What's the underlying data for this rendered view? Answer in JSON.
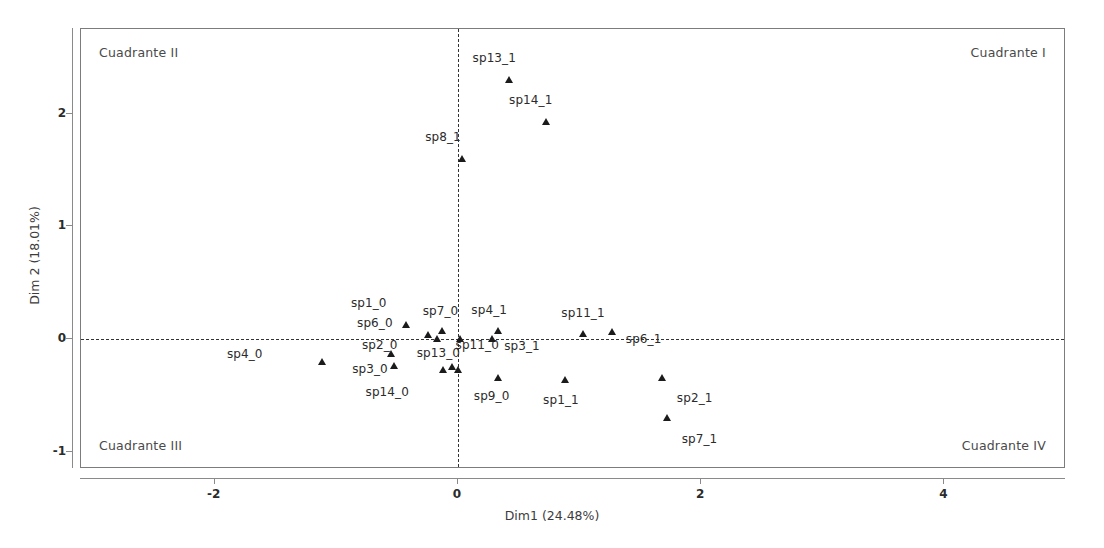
{
  "chart_data": {
    "type": "scatter",
    "title": "",
    "xlabel": "Dim1 (24.48%)",
    "ylabel": "Dim 2 (18.01%)",
    "xlim": [
      -3.1,
      5.0
    ],
    "ylim": [
      -1.15,
      2.75
    ],
    "xticks": [
      -2,
      0,
      2,
      4
    ],
    "xticklabels": [
      "-2",
      "0",
      "2",
      "4"
    ],
    "yticks": [
      -1,
      0,
      1,
      2
    ],
    "yticklabels": [
      "-1",
      "0",
      "1",
      "2"
    ],
    "grid": false,
    "legend": null,
    "reference_lines": {
      "vertical_x": 0,
      "horizontal_y": 0,
      "style": "dashed"
    },
    "annotations": [
      {
        "name": "quadrant-top-left",
        "text": "Cuadrante II"
      },
      {
        "name": "quadrant-top-right",
        "text": "Cuadrante I"
      },
      {
        "name": "quadrant-bottom-left",
        "text": "Cuadrante III"
      },
      {
        "name": "quadrant-bottom-right",
        "text": "Cuadrante IV"
      }
    ],
    "marker": {
      "shape": "triangle",
      "color": "#1b1b1b",
      "size": 7
    },
    "points": [
      {
        "label": "sp13_1",
        "x": 0.42,
        "y": 2.3,
        "lx": -0.3,
        "ly": 0.19
      },
      {
        "label": "sp14_1",
        "x": 0.72,
        "y": 1.93,
        "lx": -0.3,
        "ly": 0.19
      },
      {
        "label": "sp8_1",
        "x": 0.03,
        "y": 1.6,
        "lx": -0.3,
        "ly": 0.19
      },
      {
        "label": "sp1_0",
        "x": -0.43,
        "y": 0.13,
        "lx": -0.45,
        "ly": 0.19
      },
      {
        "label": "sp7_0",
        "x": -0.13,
        "y": 0.07,
        "lx": -0.16,
        "ly": 0.18
      },
      {
        "label": "sp6_0",
        "x": -0.25,
        "y": 0.04,
        "lx": -0.58,
        "ly": 0.1
      },
      {
        "label": "sp2_0",
        "x": -0.17,
        "y": 0.0,
        "lx": -0.62,
        "ly": -0.05
      },
      {
        "label": "sp11_0",
        "x": 0.02,
        "y": 0.0,
        "lx": -0.04,
        "ly": -0.05
      },
      {
        "label": "sp4_1",
        "x": 0.33,
        "y": 0.07,
        "lx": -0.22,
        "ly": 0.19
      },
      {
        "label": "sp3_1",
        "x": 0.28,
        "y": 0.0,
        "lx": 0.1,
        "ly": -0.06
      },
      {
        "label": "sp11_1",
        "x": 1.03,
        "y": 0.05,
        "lx": -0.18,
        "ly": 0.18
      },
      {
        "label": "sp6_1",
        "x": 1.27,
        "y": 0.06,
        "lx": 0.11,
        "ly": -0.06
      },
      {
        "label": "sp4_0",
        "x": -1.12,
        "y": -0.2,
        "lx": -0.78,
        "ly": 0.07
      },
      {
        "label": "sp3_0",
        "x": -0.55,
        "y": -0.13,
        "lx": -0.32,
        "ly": -0.13
      },
      {
        "label": "sp14_0",
        "x": -0.53,
        "y": -0.24,
        "lx": -0.23,
        "ly": -0.23
      },
      {
        "label": "sp13_0",
        "x": -0.12,
        "y": -0.27,
        "lx": -0.22,
        "ly": 0.15
      },
      {
        "label": "sp13_0b",
        "x": 0.0,
        "y": -0.27,
        "lx": null,
        "ly": null
      },
      {
        "label": "sp13_0c",
        "x": -0.05,
        "y": -0.25,
        "lx": null,
        "ly": null
      },
      {
        "label": "sp9_0",
        "x": 0.33,
        "y": -0.34,
        "lx": -0.2,
        "ly": -0.16
      },
      {
        "label": "sp1_1",
        "x": 0.88,
        "y": -0.36,
        "lx": -0.18,
        "ly": -0.18
      },
      {
        "label": "sp2_1",
        "x": 1.68,
        "y": -0.34,
        "lx": 0.12,
        "ly": -0.18
      },
      {
        "label": "sp7_1",
        "x": 1.72,
        "y": -0.7,
        "lx": 0.12,
        "ly": -0.18
      }
    ]
  }
}
